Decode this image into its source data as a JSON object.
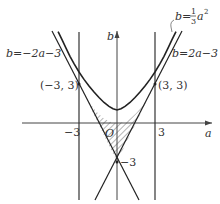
{
  "diagram": {
    "title": "",
    "axes": {
      "x_label": "a",
      "y_label": "b",
      "origin_label": "O"
    },
    "ticks": {
      "x_neg": "−3",
      "x_pos": "3",
      "y_neg": "−3"
    },
    "points": [
      {
        "label": "(−3, 3)",
        "a": -3,
        "b": 3
      },
      {
        "label": "(3, 3)",
        "a": 3,
        "b": 3
      }
    ],
    "curves": {
      "parabola": {
        "label_lhs": "b=",
        "frac_num": "1",
        "frac_den": "3",
        "label_rhs": "a",
        "exp": "2",
        "equation": "b = (1/3)a^2"
      },
      "line_pos": {
        "label": "b=2a−3",
        "equation": "b = 2a - 3"
      },
      "line_neg": {
        "label": "b=−2a−3",
        "equation": "b = -2a - 3"
      },
      "vertical_lines": [
        {
          "a": -3
        },
        {
          "a": 3
        }
      ]
    },
    "shaded_region": "region bounded by b=(1/3)a^2 above and b=2a-3, b=-2a-3 below, between a=-3 and a=3"
  }
}
